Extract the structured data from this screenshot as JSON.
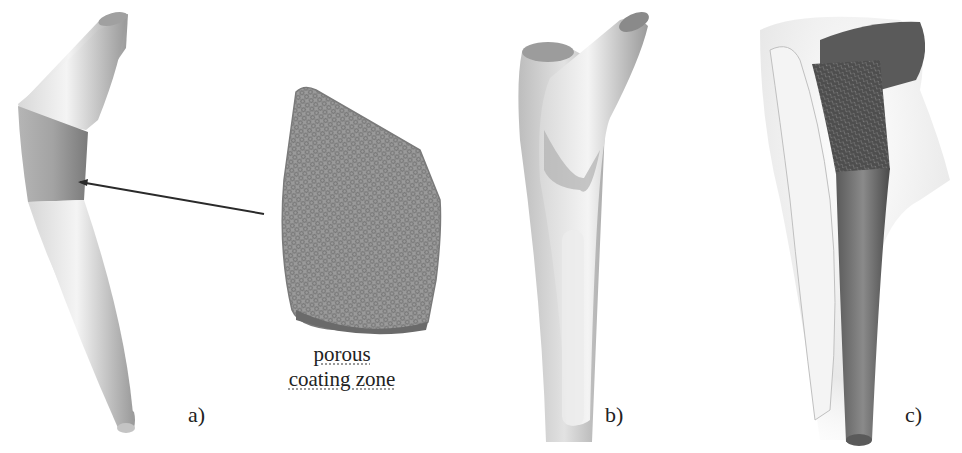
{
  "figure": {
    "panels": [
      {
        "id": "a",
        "label": "a)",
        "description": "Stem model with highlighted porous coating band"
      },
      {
        "id": "b",
        "label": "b)",
        "description": "Stem implanted in bone model"
      },
      {
        "id": "c",
        "label": "c)",
        "description": "Stem with porous lattice inside bone (rendered)"
      }
    ],
    "callout": {
      "line1": "porous",
      "line2": "coating zone"
    },
    "colors": {
      "stem_light": "#e6e6e6",
      "coating_band": "#a8a8a8",
      "lattice": "#8a8a8a",
      "bone": "#cfcfcf",
      "arrow": "#2a2a2a",
      "text": "#222222"
    }
  }
}
